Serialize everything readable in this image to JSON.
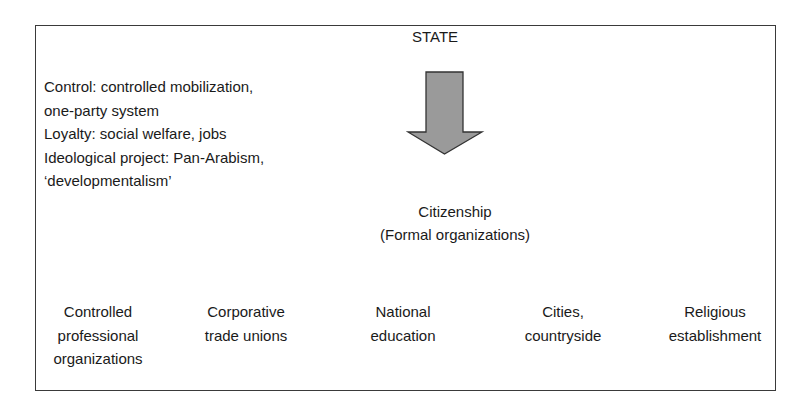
{
  "diagram": {
    "title": "STATE",
    "left_notes": [
      "Control: controlled mobilization,",
      "one-party system",
      "Loyalty: social welfare, jobs",
      "Ideological project: Pan-Arabism,",
      "‘developmentalism’"
    ],
    "arrow": {
      "icon": "down-arrow-icon",
      "fill": "#999999",
      "stroke": "#333333"
    },
    "center": {
      "line1": "Citizenship",
      "line2": "(Formal organizations)"
    },
    "organizations": [
      {
        "lines": [
          "Controlled",
          "professional",
          "organizations"
        ]
      },
      {
        "lines": [
          "Corporative",
          "trade unions"
        ]
      },
      {
        "lines": [
          "National",
          "education"
        ]
      },
      {
        "lines": [
          "Cities,",
          "countryside"
        ]
      },
      {
        "lines": [
          "Religious",
          "establishment"
        ]
      }
    ]
  }
}
